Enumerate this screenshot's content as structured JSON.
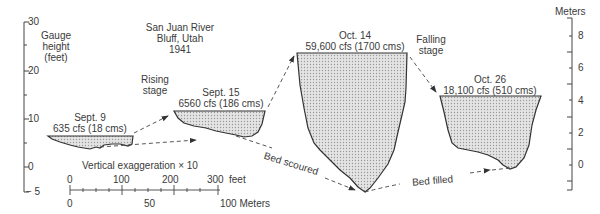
{
  "title": {
    "line1": "San Juan River",
    "line2": "Bluff, Utah",
    "line3": "1941"
  },
  "left_axis": {
    "label_line1": "Gauge",
    "label_line2": "height",
    "label_line3": "(feet)",
    "ticks": [
      "30",
      "20",
      "10",
      "0",
      "− 5"
    ]
  },
  "right_axis": {
    "label": "Meters",
    "ticks": [
      "8",
      "6",
      "4",
      "2",
      "0"
    ]
  },
  "sections": [
    {
      "date": "Sept. 9",
      "flow": "635 cfs (18 cms)"
    },
    {
      "date": "Sept. 15",
      "flow": "6560 cfs (186 cms)"
    },
    {
      "date": "Oct. 14",
      "flow": "59,600 cfs (1700 cms)"
    },
    {
      "date": "Oct. 26",
      "flow": "18,100 cfs (510 cms)"
    }
  ],
  "annotations": {
    "rising_l1": "Rising",
    "rising_l2": "stage",
    "falling_l1": "Falling",
    "falling_l2": "stage",
    "bed_scoured": "Bed scoured",
    "bed_filled": "Bed filled",
    "exaggeration": "Vertical exaggeration × 10"
  },
  "scale_bar": {
    "feet_ticks": [
      "0",
      "100",
      "200",
      "300"
    ],
    "feet_unit": "feet",
    "meter_ticks": [
      "0",
      "50"
    ],
    "meter_end": "100 Meters"
  },
  "colors": {
    "fill": "#d4d4d4",
    "line": "#333333"
  }
}
